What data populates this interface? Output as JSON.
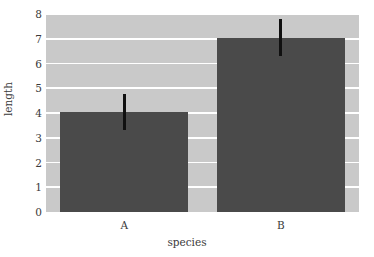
{
  "chart_data": {
    "type": "bar",
    "title": "",
    "xlabel": "species",
    "ylabel": "length",
    "categories": [
      "A",
      "B"
    ],
    "values": [
      4.05,
      7.05
    ],
    "errors_low": [
      3.3,
      6.3
    ],
    "errors_high": [
      4.75,
      7.8
    ],
    "ylim": [
      0,
      8
    ],
    "yticks": [
      0,
      1,
      2,
      3,
      4,
      5,
      6,
      7,
      8
    ],
    "ytick_labels": [
      "0",
      "1",
      "2",
      "3",
      "4",
      "5",
      "6",
      "7",
      "8"
    ],
    "xtick_labels": [
      "A",
      "B"
    ],
    "grid": true,
    "grid_axis": "y",
    "legend": null,
    "style": "darkgrid",
    "colors": {
      "bar_fill": "#4a4a4a",
      "errorbar": "#101010",
      "plot_background": "#c9c9c9",
      "gridline": "#ffffff",
      "figure_background": "#ffffff",
      "text": "#3a3a3a"
    }
  }
}
